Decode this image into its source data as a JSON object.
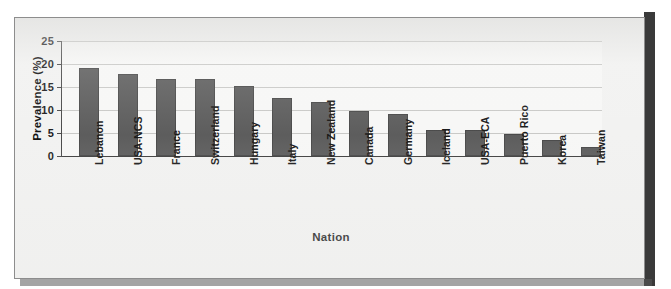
{
  "figure": {
    "background_color": "#f2f2f1",
    "frame_border_color": "#8d8d8d",
    "shadow_color": "#3a3a3a"
  },
  "chart_data": {
    "type": "bar",
    "title": "",
    "xlabel": "Nation",
    "ylabel": "Prevalence (%)",
    "categories": [
      "Lebanon",
      "USA-NCS",
      "France",
      "Switzerland",
      "Hungary",
      "Italy",
      "New Zealand",
      "Canada",
      "Germany",
      "Iceland",
      "USA-ECA",
      "Puerto Rico",
      "Korea",
      "Taiwan"
    ],
    "values": [
      19.2,
      17.8,
      16.7,
      16.7,
      15.2,
      12.7,
      11.8,
      9.8,
      9.1,
      5.6,
      5.6,
      4.7,
      3.5,
      2.0
    ],
    "ylim": [
      0,
      25
    ],
    "yticks": [
      0,
      5,
      10,
      15,
      20,
      25
    ],
    "ytick_labels": [
      "0",
      "5",
      "10",
      "15",
      "20",
      "25"
    ],
    "grid": true,
    "grid_axis": "y",
    "legend": false,
    "bar_color": "#5d5d5d",
    "plot_background": "#f7f7f6",
    "axis_color": "#4a4a4a",
    "gridline_color": "#c9c9c7"
  }
}
